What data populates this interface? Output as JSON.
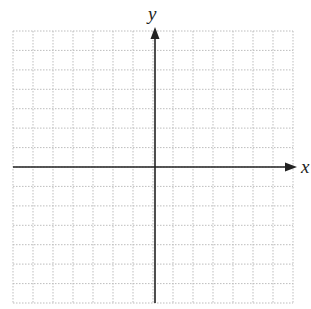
{
  "diagram": {
    "type": "coordinate-plane",
    "grid": {
      "left": 13,
      "top": 31,
      "right": 293,
      "bottom": 303,
      "columns": 14,
      "rows": 14,
      "line_style": "dotted",
      "line_color": "#bdbdbd"
    },
    "axes": {
      "origin": {
        "x": 155,
        "y": 167
      },
      "x_axis": {
        "label": "x",
        "from": 13,
        "to": 297,
        "arrow": "right"
      },
      "y_axis": {
        "label": "y",
        "from": 303,
        "to": 27,
        "arrow": "up"
      },
      "color": "#222222"
    }
  }
}
